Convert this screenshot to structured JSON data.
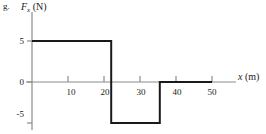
{
  "figure": {
    "part_letter": "g.",
    "y_axis_title_symbol": "F",
    "y_axis_title_subscript": "x",
    "y_axis_title_unit": "(N)",
    "x_axis_title_symbol": "x",
    "x_axis_title_unit": "(m)",
    "axis_color": "#8c8c8c",
    "curve_color": "#1a1a1a",
    "background_color": "#ffffff"
  },
  "chart_data": {
    "type": "line",
    "title": "",
    "subtitle": "",
    "xlabel": "x (m)",
    "ylabel": "F_x (N)",
    "xlim": [
      0,
      53
    ],
    "ylim": [
      -7,
      7
    ],
    "grid": false,
    "legend": null,
    "xticks": [
      10,
      20,
      30,
      40,
      50
    ],
    "xtick_labels": [
      "10",
      "20",
      "30",
      "40",
      "50"
    ],
    "yticks": [
      5,
      0,
      -5
    ],
    "ytick_labels": [
      "5",
      "0",
      "-5"
    ],
    "series": [
      {
        "name": "Fx",
        "step": "post",
        "x": [
          0,
          22,
          22,
          35.5,
          35.5,
          50
        ],
        "y": [
          5,
          5,
          -5,
          -5,
          0,
          0
        ]
      }
    ],
    "segments": [
      {
        "label": "segment-1",
        "x_start": 0,
        "x_end": 22,
        "value": 5
      },
      {
        "label": "segment-2",
        "x_start": 22,
        "x_end": 35.5,
        "value": -5
      },
      {
        "label": "segment-3",
        "x_start": 35.5,
        "x_end": 50,
        "value": 0
      }
    ]
  }
}
